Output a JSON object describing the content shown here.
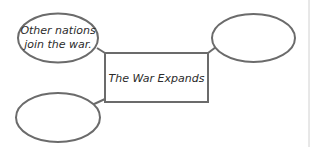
{
  "diagram": {
    "type": "web-organizer",
    "center": {
      "label": "The War Expands"
    },
    "nodes": [
      {
        "position": "top-left",
        "lines": [
          "Other nations",
          "join the war."
        ]
      },
      {
        "position": "top-right",
        "lines": []
      },
      {
        "position": "bottom-left",
        "lines": []
      }
    ]
  },
  "colors": {
    "stroke": "#6b6b6b",
    "text": "#2b2b2b",
    "background": "#ffffff",
    "divider": "#cfcfcf"
  }
}
